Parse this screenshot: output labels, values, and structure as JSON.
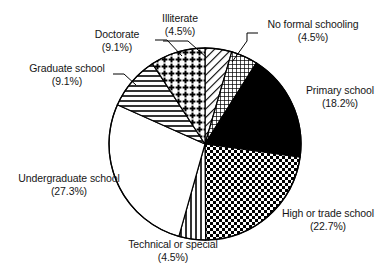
{
  "chart_data": {
    "type": "pie",
    "title": "",
    "subtitle": "",
    "xlabel": "",
    "ylabel": "",
    "legend_position": "none",
    "grid": false,
    "start_angle_deg": 0,
    "direction": "clockwise",
    "units": "percent",
    "categories": [
      "Illiterate",
      "No formal schooling",
      "Primary school",
      "High or trade school",
      "Technical or special",
      "Undergraduate school",
      "Graduate school",
      "Doctorate"
    ],
    "values": [
      4.5,
      4.5,
      18.2,
      22.7,
      4.5,
      27.3,
      9.1,
      9.1
    ],
    "slices": [
      {
        "label": "Illiterate",
        "percent_text": "(4.5%)",
        "value": 4.5,
        "pattern": "diagonal-hatch",
        "fill": "#ffffff",
        "ink": "#000000",
        "start_deg": 0.0,
        "end_deg": 16.2
      },
      {
        "label": "No formal schooling",
        "percent_text": "(4.5%)",
        "value": 4.5,
        "pattern": "fine-crosshatch",
        "fill": "#ffffff",
        "ink": "#000000",
        "start_deg": 16.2,
        "end_deg": 32.4
      },
      {
        "label": "Primary school",
        "percent_text": "(18.2%)",
        "value": 18.2,
        "pattern": "solid",
        "fill": "#000000",
        "ink": "#000000",
        "start_deg": 32.4,
        "end_deg": 97.9
      },
      {
        "label": "High or trade school",
        "percent_text": "(22.7%)",
        "value": 22.7,
        "pattern": "checkerboard",
        "fill": "#ffffff",
        "ink": "#000000",
        "start_deg": 97.9,
        "end_deg": 179.6
      },
      {
        "label": "Technical or special",
        "percent_text": "(4.5%)",
        "value": 4.5,
        "pattern": "vertical-stripes",
        "fill": "#ffffff",
        "ink": "#000000",
        "start_deg": 179.6,
        "end_deg": 195.8
      },
      {
        "label": "Undergraduate school",
        "percent_text": "(27.3%)",
        "value": 27.3,
        "pattern": "blank",
        "fill": "#ffffff",
        "ink": "#000000",
        "start_deg": 195.8,
        "end_deg": 294.1
      },
      {
        "label": "Graduate school",
        "percent_text": "(9.1%)",
        "value": 9.1,
        "pattern": "horizontal-stripes",
        "fill": "#ffffff",
        "ink": "#000000",
        "start_deg": 294.1,
        "end_deg": 326.8
      },
      {
        "label": "Doctorate",
        "percent_text": "(9.1%)",
        "value": 9.1,
        "pattern": "dotted-grid",
        "fill": "#ffffff",
        "ink": "#000000",
        "start_deg": 326.8,
        "end_deg": 360.0
      }
    ],
    "geometry": {
      "center_x": 205,
      "center_y": 144,
      "radius": 96
    },
    "colors": {
      "ink": "#000000",
      "background": "#ffffff",
      "text": "#161616"
    }
  }
}
